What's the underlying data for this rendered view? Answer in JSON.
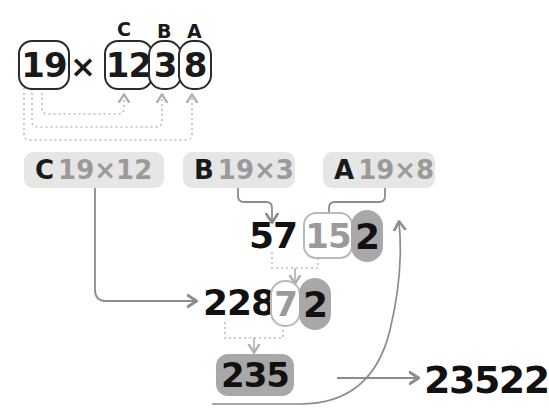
{
  "problem": {
    "multiplicand": "19",
    "operator": "×",
    "multiplier_digits": [
      "12",
      "3",
      "8"
    ],
    "tags": [
      "C",
      "B",
      "A"
    ]
  },
  "steps": [
    {
      "tag": "C",
      "expr": "19×12"
    },
    {
      "tag": "B",
      "expr": "19×3"
    },
    {
      "tag": "A",
      "expr": "19×8"
    }
  ],
  "row_partials": {
    "b_result": "57",
    "a_result_carry": "15",
    "a_result_kept": "2"
  },
  "row_sums": {
    "c_result": "228",
    "sum_carry": "7",
    "sum_kept": "2"
  },
  "total_badge": "235",
  "final_answer": "23522",
  "colors": {
    "ink": "#111111",
    "muted": "#9a9a9a",
    "chip_bg": "#e6e6e6",
    "kept_bg": "#a8a8a8",
    "line": "#8c8c8c",
    "dotted": "#bdbdbd"
  }
}
